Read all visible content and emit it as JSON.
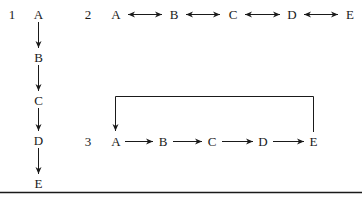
{
  "diagrams": [
    {
      "number": "1",
      "layout": "vertical chain",
      "nodes": [
        "A",
        "B",
        "C",
        "D",
        "E"
      ],
      "edges": [
        [
          "A",
          "B",
          "directed"
        ],
        [
          "B",
          "C",
          "directed"
        ],
        [
          "C",
          "D",
          "directed"
        ],
        [
          "D",
          "E",
          "directed"
        ]
      ]
    },
    {
      "number": "2",
      "layout": "horizontal chain",
      "nodes": [
        "A",
        "B",
        "C",
        "D",
        "E"
      ],
      "edges": [
        [
          "A",
          "B",
          "bidirectional"
        ],
        [
          "B",
          "C",
          "bidirectional"
        ],
        [
          "C",
          "D",
          "bidirectional"
        ],
        [
          "D",
          "E",
          "bidirectional"
        ]
      ]
    },
    {
      "number": "3",
      "layout": "horizontal cycle",
      "nodes": [
        "A",
        "B",
        "C",
        "D",
        "E"
      ],
      "edges": [
        [
          "A",
          "B",
          "directed"
        ],
        [
          "B",
          "C",
          "directed"
        ],
        [
          "C",
          "D",
          "directed"
        ],
        [
          "D",
          "E",
          "directed"
        ],
        [
          "E",
          "A",
          "directed feedback loop"
        ]
      ]
    }
  ],
  "colors": {
    "ink": "#1a1a1a",
    "background": "#ffffff"
  }
}
